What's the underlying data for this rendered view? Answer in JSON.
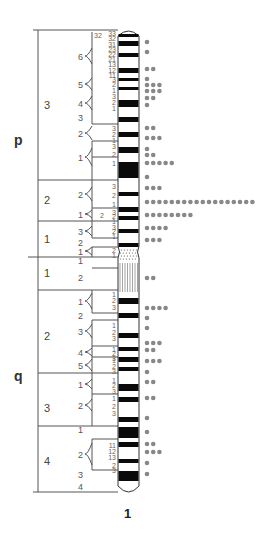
{
  "diagram": {
    "type": "chromosome-ideogram",
    "chromosome_label": "1",
    "arms": [
      {
        "id": "p",
        "label": "p"
      },
      {
        "id": "q",
        "label": "q"
      }
    ],
    "colors": {
      "band_dark": "#0a0a0a",
      "band_light": "#ffffff",
      "outline": "#333333",
      "dot": "#888888",
      "line": "#555555"
    },
    "regions": [
      {
        "arm": "p",
        "label": "3"
      },
      {
        "arm": "p",
        "label": "2"
      },
      {
        "arm": "p",
        "label": "1"
      },
      {
        "arm": "q",
        "label": "1"
      },
      {
        "arm": "q",
        "label": "2"
      },
      {
        "arm": "q",
        "label": "3"
      },
      {
        "arm": "q",
        "label": "4"
      }
    ],
    "bands": [
      {
        "region": "p3",
        "label": "6",
        "subbands": [
          "33",
          "32",
          "31",
          "23",
          "22",
          "21",
          "13",
          "12",
          "11"
        ],
        "extra": "32"
      },
      {
        "region": "p3",
        "label": "5",
        "subbands": [
          "3",
          "2",
          "1"
        ]
      },
      {
        "region": "p3",
        "label": "4",
        "subbands": [
          "3",
          "2",
          "1"
        ]
      },
      {
        "region": "p3",
        "label": "3",
        "subbands": []
      },
      {
        "region": "p3",
        "label": "2",
        "subbands": [
          "3",
          "2",
          "1"
        ]
      },
      {
        "region": "p3",
        "label": "1",
        "subbands": [
          "3",
          "2",
          "1"
        ]
      },
      {
        "region": "p2",
        "label": "2",
        "subbands": [
          "3",
          "2",
          "1"
        ]
      },
      {
        "region": "p2",
        "label": "1",
        "subbands": [
          "3",
          "2",
          "1"
        ],
        "extra": "2"
      },
      {
        "region": "p1",
        "label": "3",
        "subbands": [
          "3",
          "2",
          "1"
        ]
      },
      {
        "region": "p1",
        "label": "2",
        "subbands": []
      },
      {
        "region": "p1",
        "label": "1",
        "subbands": [
          "2",
          "1"
        ]
      },
      {
        "region": "q1",
        "label": "1",
        "subbands": []
      },
      {
        "region": "q1",
        "label": "2",
        "subbands": []
      },
      {
        "region": "q2",
        "label": "1",
        "subbands": [
          "1",
          "2",
          "3"
        ]
      },
      {
        "region": "q2",
        "label": "2",
        "subbands": []
      },
      {
        "region": "q2",
        "label": "3",
        "subbands": [
          "1",
          "2",
          "3"
        ]
      },
      {
        "region": "q2",
        "label": "4",
        "subbands": [
          "1",
          "2",
          "3"
        ]
      },
      {
        "region": "q2",
        "label": "5",
        "subbands": [
          "1",
          "2",
          "3"
        ]
      },
      {
        "region": "q3",
        "label": "1",
        "subbands": [
          "1",
          "2",
          "3"
        ]
      },
      {
        "region": "q3",
        "label": "2",
        "subbands": [
          "1",
          "2",
          "3"
        ]
      },
      {
        "region": "q4",
        "label": "1",
        "subbands": []
      },
      {
        "region": "q4",
        "label": "2",
        "subbands": [
          "11",
          "12",
          "13",
          "2",
          "3"
        ]
      },
      {
        "region": "q4",
        "label": "3",
        "subbands": []
      },
      {
        "region": "q4",
        "label": "4",
        "subbands": []
      }
    ],
    "dot_counts_top_to_bottom": [
      1,
      1,
      2,
      1,
      3,
      3,
      2,
      1,
      2,
      3,
      1,
      2,
      5,
      1,
      3,
      18,
      8,
      4,
      3,
      2,
      4,
      1,
      1,
      3,
      2,
      3,
      1,
      2,
      2,
      1,
      1,
      2,
      3,
      1,
      1
    ]
  }
}
